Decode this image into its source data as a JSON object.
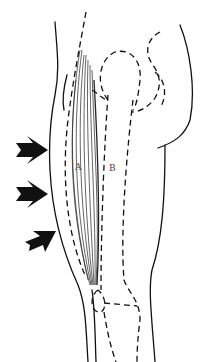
{
  "figure": {
    "labels": {
      "muscle": "A",
      "bone": "B"
    },
    "arrows": [
      {
        "name": "arrow-top",
        "x": 15,
        "y": 150
      },
      {
        "name": "arrow-middle",
        "x": 15,
        "y": 195
      },
      {
        "name": "arrow-bottom",
        "x": 25,
        "y": 240
      }
    ],
    "colors": {
      "ink": "#111111",
      "background": "#ffffff"
    }
  }
}
